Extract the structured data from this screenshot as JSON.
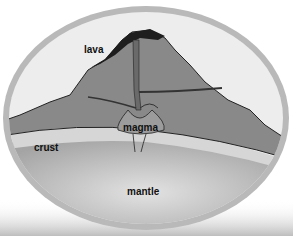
{
  "diagram": {
    "labels": {
      "lava": "lava",
      "magma": "magma",
      "crust": "crust",
      "mantle": "mantle"
    },
    "colors": {
      "ring": "#b9b9b9",
      "sky": "#ececec",
      "volcano": "#8a8a8a",
      "lava": "#1e1e1e",
      "crust": "#d4d4d4",
      "mantle": "#a9a9a9",
      "mantle_light": "#d9d9d9"
    }
  }
}
